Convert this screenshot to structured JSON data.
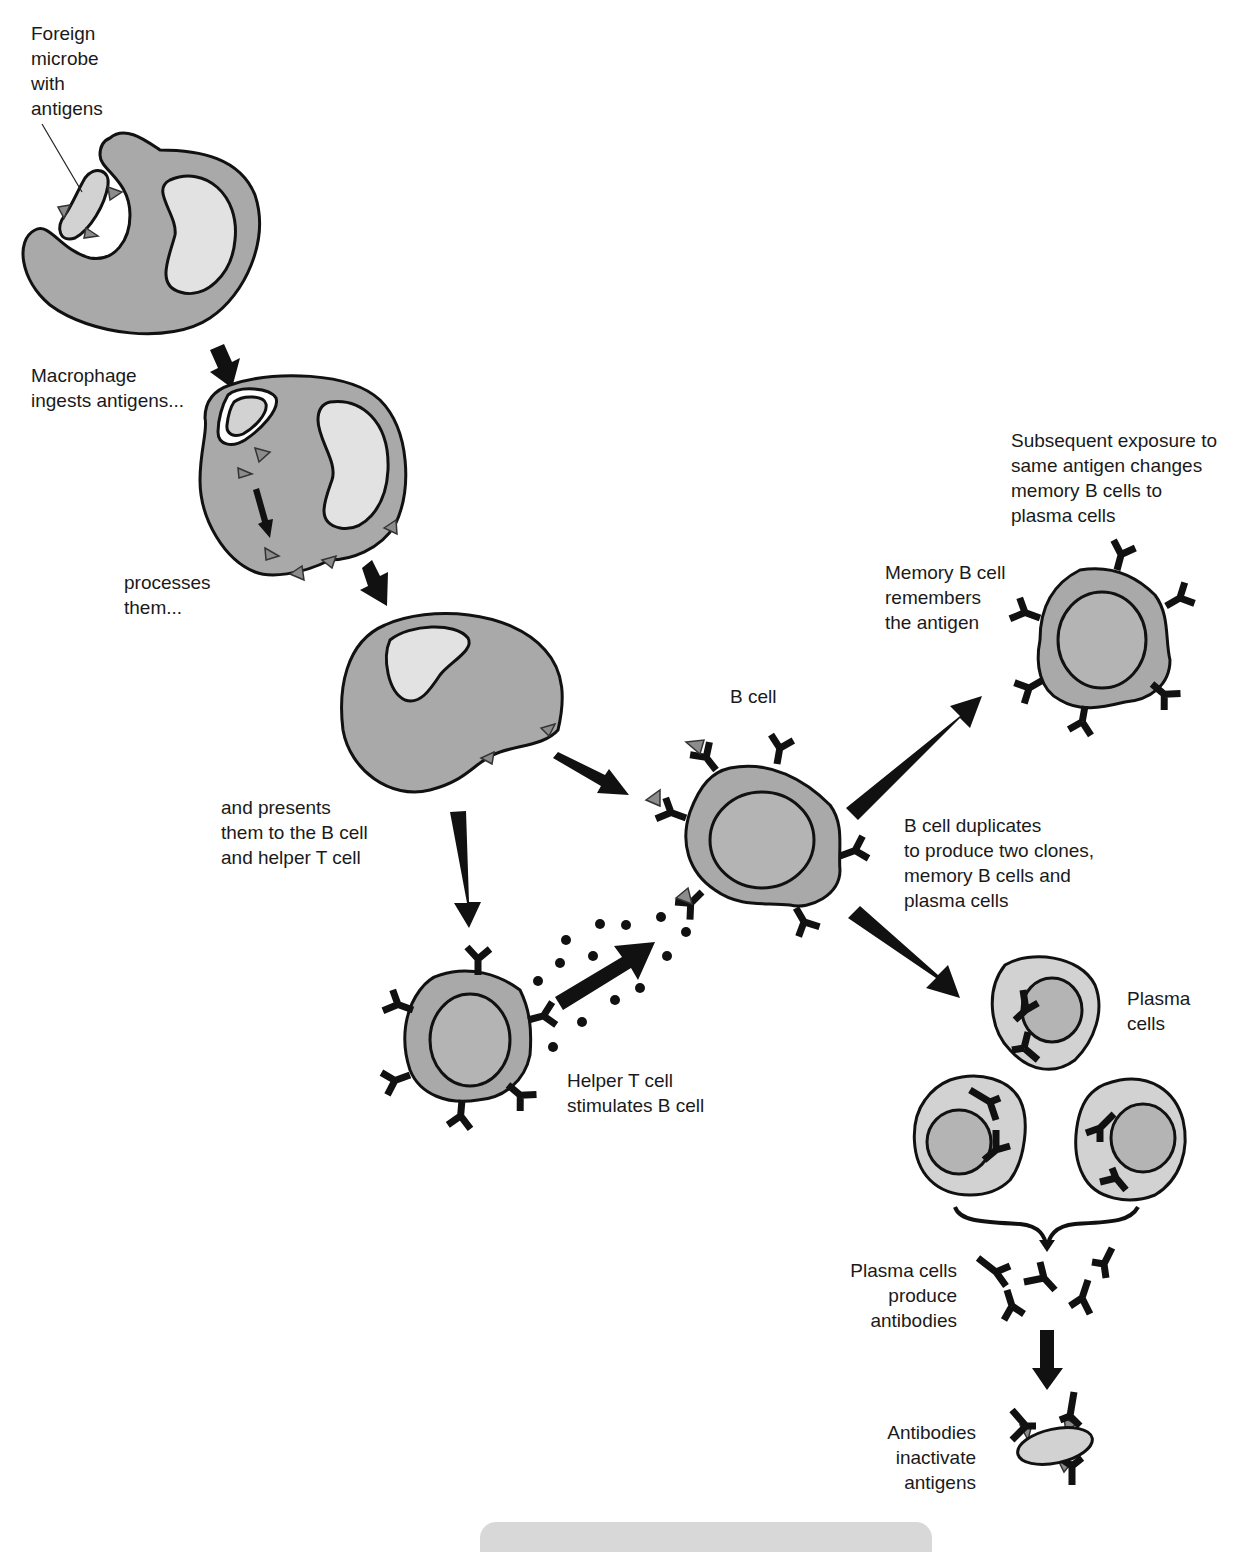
{
  "labels": {
    "foreign_microbe": "Foreign\nmicrobe\nwith\nantigens",
    "macrophage_ingests": "Macrophage\ningests antigens...",
    "processes": "processes\nthem...",
    "presents": "and presents\nthem to the B cell\nand helper T cell",
    "b_cell": "B cell",
    "helper_t": "Helper T cell\nstimulates B cell",
    "duplicates": "B cell duplicates\nto produce two clones,\nmemory B cells and\nplasma cells",
    "subsequent": "Subsequent exposure to\nsame antigen changes\nmemory B cells to\nplasma cells",
    "memory_b": "Memory B cell\nremembers\nthe antigen",
    "plasma_cells": "Plasma\ncells",
    "produce_antibodies": "Plasma cells\nproduce\nantibodies",
    "inactivate": "Antibodies\ninactivate\nantigens"
  },
  "colors": {
    "cell_fill": "#a9a9a9",
    "plasma_cell_fill": "#d2d2d2",
    "nucleus_fill": "#e2e2e2",
    "antigen_fill": "#8c8c8c",
    "outline": "#111111"
  }
}
